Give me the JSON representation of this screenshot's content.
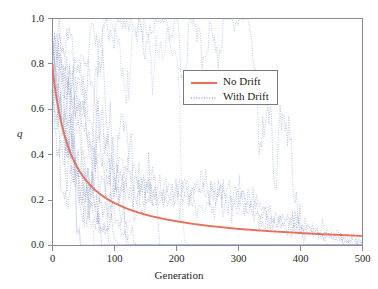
{
  "chart_data": {
    "type": "line",
    "title": "",
    "xlabel": "Generation",
    "ylabel": "q",
    "xlim": [
      0,
      500
    ],
    "ylim": [
      0.0,
      1.0
    ],
    "xticks": [
      0,
      100,
      200,
      300,
      400,
      500
    ],
    "xtick_labels": [
      "0",
      "100",
      "200",
      "300",
      "400",
      "500"
    ],
    "yticks": [
      0.0,
      0.2,
      0.4,
      0.6,
      0.8,
      1.0
    ],
    "ytick_labels": [
      "0.0",
      "0.2",
      "0.4",
      "0.6",
      "0.8",
      "1.0"
    ],
    "grid": false,
    "legend_position": "upper-center-right",
    "legend": [
      {
        "label": "No Drift",
        "style": "solid",
        "color": "#e8705a"
      },
      {
        "label": "With Drift",
        "style": "dotted",
        "color": "#9aa8d4"
      }
    ],
    "series": [
      {
        "name": "No Drift",
        "style": "solid",
        "color": "#e8705a",
        "x": [
          0,
          5,
          10,
          15,
          20,
          25,
          30,
          35,
          40,
          45,
          50,
          60,
          70,
          80,
          90,
          100,
          120,
          140,
          160,
          180,
          200,
          225,
          250,
          275,
          300,
          325,
          350,
          375,
          400,
          425,
          450,
          475,
          500
        ],
        "y": [
          0.8,
          0.688,
          0.604,
          0.538,
          0.485,
          0.441,
          0.404,
          0.373,
          0.346,
          0.323,
          0.302,
          0.268,
          0.241,
          0.219,
          0.201,
          0.186,
          0.161,
          0.142,
          0.127,
          0.115,
          0.105,
          0.094,
          0.085,
          0.078,
          0.071,
          0.066,
          0.061,
          0.057,
          0.053,
          0.049,
          0.046,
          0.043,
          0.04
        ]
      },
      {
        "name": "With Drift",
        "style": "dotted",
        "color": "#9aa8d4",
        "description": "Multiple stochastic replicate trajectories starting at q = 0.8, decaying noisily toward 0 with large variance; some replicates rise above 0.7 near generation 40-50 before declining, others fix at 0 by generation 150-350.",
        "replicates": 12,
        "envelope_upper_x": [
          0,
          20,
          40,
          50,
          70,
          90,
          110,
          130,
          150,
          175,
          200,
          230,
          260,
          290,
          320,
          350,
          380,
          420,
          460,
          500
        ],
        "envelope_upper_y": [
          0.8,
          0.64,
          0.72,
          0.7,
          0.44,
          0.32,
          0.3,
          0.26,
          0.25,
          0.23,
          0.22,
          0.23,
          0.22,
          0.2,
          0.17,
          0.12,
          0.1,
          0.06,
          0.03,
          0.01
        ],
        "envelope_lower_x": [
          0,
          20,
          40,
          60,
          80,
          100,
          120,
          150,
          200,
          250,
          300,
          350,
          400,
          450,
          500
        ],
        "envelope_lower_y": [
          0.8,
          0.46,
          0.26,
          0.14,
          0.07,
          0.04,
          0.02,
          0.01,
          0.0,
          0.0,
          0.0,
          0.0,
          0.0,
          0.0,
          0.0
        ]
      }
    ]
  },
  "axes": {
    "frame_color": "#8a8a90",
    "tick_color": "#8a8a90",
    "background": "#ffffff"
  }
}
